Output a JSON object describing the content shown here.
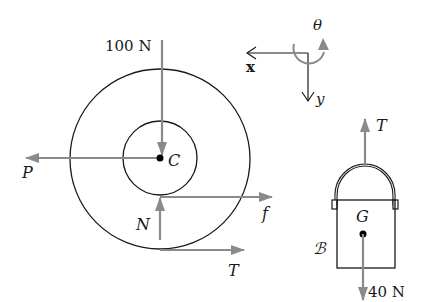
{
  "diagram": {
    "colors": {
      "line": "#1a1a1a",
      "force": "#8a8a8a",
      "background": "#ffffff"
    },
    "coordinate_system": {
      "x_label": "x",
      "y_label": "y",
      "theta_label": "θ"
    },
    "spool": {
      "center_label": "C",
      "forces": {
        "applied_top": "100 N",
        "left": "P",
        "normal": "N",
        "friction": "f",
        "tension": "T"
      }
    },
    "bucket": {
      "body_label": "ℬ",
      "center_label": "G",
      "forces": {
        "tension": "T",
        "weight": "40 N"
      }
    }
  }
}
